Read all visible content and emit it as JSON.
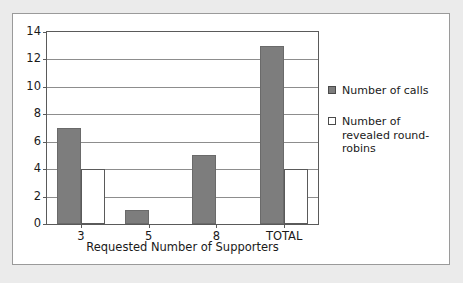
{
  "chart_data": {
    "type": "bar",
    "title": "",
    "xlabel": "Requested Number of Supporters",
    "ylabel": "",
    "categories": [
      "3",
      "5",
      "8",
      "TOTAL"
    ],
    "series": [
      {
        "name": "Number of calls",
        "color": "#7d7d7d",
        "values": [
          7,
          1,
          5,
          13
        ]
      },
      {
        "name": "Number of revealed round-robins",
        "color": "#ffffff",
        "values": [
          4,
          0,
          0,
          4
        ]
      }
    ],
    "ylim": [
      0,
      14
    ],
    "yticks": [
      0,
      2,
      4,
      6,
      8,
      10,
      12,
      14
    ],
    "ytick_labels": [
      "0",
      "2",
      "4",
      "6",
      "8",
      "10",
      "12",
      "14"
    ],
    "grid": true,
    "legend_position": "right",
    "legend": [
      {
        "label": "Number of calls",
        "swatch": "filled-gray-square"
      },
      {
        "label": "Number of revealed round-robins",
        "swatch": "empty-white-square"
      }
    ]
  }
}
